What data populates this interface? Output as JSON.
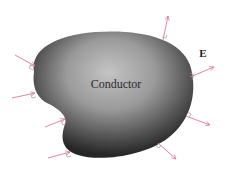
{
  "diagram": {
    "conductor_label": "Conductor",
    "field_label": "E",
    "colors": {
      "field_line": "#e0789a",
      "marker": "#9a9a9a",
      "conductor_dark": "#2e2e2e",
      "conductor_light": "#bdbdbd",
      "background": "#ffffff"
    },
    "field_lines": [
      {
        "id": "left-1",
        "x1": 15,
        "y1": 55,
        "x2": 35,
        "y2": 66,
        "direction": "inward"
      },
      {
        "id": "left-2",
        "x1": 12,
        "y1": 98,
        "x2": 35,
        "y2": 93,
        "direction": "inward"
      },
      {
        "id": "left-3",
        "x1": 45,
        "y1": 127,
        "x2": 65,
        "y2": 119,
        "direction": "inward"
      },
      {
        "id": "left-4",
        "x1": 48,
        "y1": 158,
        "x2": 70,
        "y2": 152,
        "direction": "inward"
      },
      {
        "id": "right-top",
        "x1": 163,
        "y1": 40,
        "x2": 168,
        "y2": 16,
        "direction": "outward"
      },
      {
        "id": "right-1",
        "x1": 190,
        "y1": 77,
        "x2": 214,
        "y2": 67,
        "direction": "outward"
      },
      {
        "id": "right-2",
        "x1": 186,
        "y1": 116,
        "x2": 210,
        "y2": 125,
        "direction": "outward"
      },
      {
        "id": "right-3",
        "x1": 158,
        "y1": 143,
        "x2": 176,
        "y2": 159,
        "direction": "outward"
      }
    ]
  }
}
